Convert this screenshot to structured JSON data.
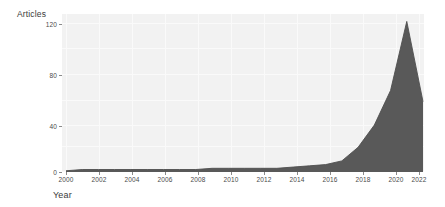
{
  "chart_data": {
    "type": "area",
    "title": "",
    "xlabel": "Year",
    "ylabel": "Articles",
    "xlim": [
      2000,
      2022
    ],
    "ylim": [
      0,
      128
    ],
    "grid": true,
    "legend_position": "none",
    "x_tick_labels": [
      "2000",
      "2002",
      "2004",
      "2006",
      "2008",
      "2010",
      "2012",
      "2014",
      "2016",
      "2018",
      "2020",
      "2022"
    ],
    "y_tick_labels": [
      "0",
      "40",
      "80",
      "120"
    ],
    "x_ticks": [
      2000,
      2002,
      2004,
      2006,
      2008,
      2010,
      2012,
      2014,
      2016,
      2018,
      2020,
      2022
    ],
    "y_ticks": [
      0,
      40,
      80,
      120
    ],
    "series": [
      {
        "name": "Articles",
        "fill_color": "#595959",
        "line_color": "#4f4f4f",
        "x": [
          2000,
          2001,
          2002,
          2003,
          2004,
          2005,
          2006,
          2007,
          2008,
          2009,
          2010,
          2011,
          2012,
          2013,
          2014,
          2015,
          2016,
          2017,
          2018,
          2019,
          2020,
          2021,
          2022
        ],
        "values": [
          1,
          2,
          2,
          2,
          2,
          2,
          2,
          2,
          2,
          3,
          3,
          3,
          3,
          3,
          4,
          5,
          6,
          9,
          20,
          38,
          66,
          122,
          57
        ]
      }
    ]
  },
  "axes": {
    "y_title": "Articles",
    "x_title": "Year"
  },
  "colors": {
    "panel_background": "#f2f2f2",
    "gridline": "#fafafa",
    "area_fill": "#595959",
    "tick_text": "#4a4a4a",
    "title_text": "#3a3a3a",
    "page_background": "#ffffff"
  }
}
